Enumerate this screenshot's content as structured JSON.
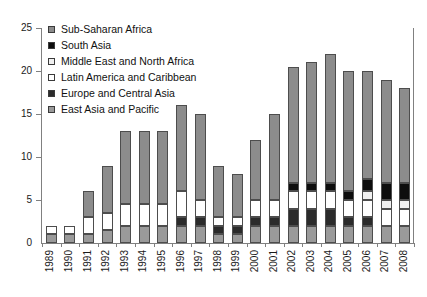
{
  "chart_data": {
    "type": "bar",
    "title": "",
    "subtitle": "",
    "xlabel": "",
    "ylabel": "",
    "stacked": true,
    "orientation": "vertical",
    "grid": false,
    "legend_position": "top-left",
    "ylim": [
      0,
      25
    ],
    "yticks": [
      0,
      5,
      10,
      15,
      20,
      25
    ],
    "ytick_labels": [
      "0",
      "5",
      "10",
      "15",
      "20",
      "25"
    ],
    "categories": [
      "1989",
      "1990",
      "1991",
      "1992",
      "1993",
      "1994",
      "1995",
      "1996",
      "1997",
      "1998",
      "1999",
      "2000",
      "2001",
      "2002",
      "2003",
      "2004",
      "2005",
      "2006",
      "2007",
      "2008"
    ],
    "series": [
      {
        "name": "East Asia and Pacific",
        "color": "#9a9a9a",
        "values": [
          1,
          1,
          1,
          1.5,
          2,
          2,
          2,
          2,
          2,
          1,
          1,
          2,
          2,
          2,
          2,
          2,
          2,
          2,
          2,
          2
        ]
      },
      {
        "name": "Europe and Central Asia",
        "color": "#2b2b2b",
        "values": [
          0,
          0,
          0,
          0,
          0,
          0,
          0,
          1,
          1,
          1,
          1,
          1,
          1,
          2,
          2,
          2,
          1,
          1,
          0,
          0
        ]
      },
      {
        "name": "Latin America and Caribbean",
        "color": "#ffffff",
        "values": [
          1,
          1,
          2,
          2,
          2.5,
          2.5,
          2.5,
          3,
          2,
          1,
          1,
          2,
          2,
          2,
          2,
          2,
          2,
          2,
          2,
          2
        ]
      },
      {
        "name": "Middle East and North Africa",
        "color": "#f0f0f0",
        "values": [
          0,
          0,
          0,
          0,
          0,
          0,
          0,
          0,
          0,
          0,
          0,
          0,
          0,
          0,
          0,
          0,
          0,
          1,
          1,
          1
        ]
      },
      {
        "name": "South Asia",
        "color": "#0d0d0d",
        "values": [
          0,
          0,
          0,
          0,
          0,
          0,
          0,
          0,
          0,
          0,
          0,
          0,
          0,
          1,
          1,
          1,
          1,
          1.5,
          2,
          2
        ]
      },
      {
        "name": "Sub-Saharan Africa",
        "color": "#8c8c8c",
        "values": [
          0,
          0,
          3,
          5.5,
          8.5,
          8.5,
          8.5,
          10,
          10,
          6,
          5,
          7,
          10,
          13.5,
          14,
          15,
          14,
          12.5,
          12,
          11
        ]
      }
    ],
    "totals": [
      2,
      2,
      6,
      9,
      13,
      13,
      13,
      16,
      15,
      9,
      7,
      12,
      15,
      20.5,
      21,
      22,
      20,
      20,
      19,
      18
    ]
  },
  "legend": {
    "items": [
      {
        "label": "Sub-Saharan Africa",
        "color": "#8c8c8c"
      },
      {
        "label": "South Asia",
        "color": "#0d0d0d"
      },
      {
        "label": "Middle East and North Africa",
        "color": "#f0f0f0"
      },
      {
        "label": "Latin America and Caribbean",
        "color": "#ffffff"
      },
      {
        "label": "Europe and Central Asia",
        "color": "#2b2b2b"
      },
      {
        "label": "East Asia and Pacific",
        "color": "#9a9a9a"
      }
    ]
  }
}
